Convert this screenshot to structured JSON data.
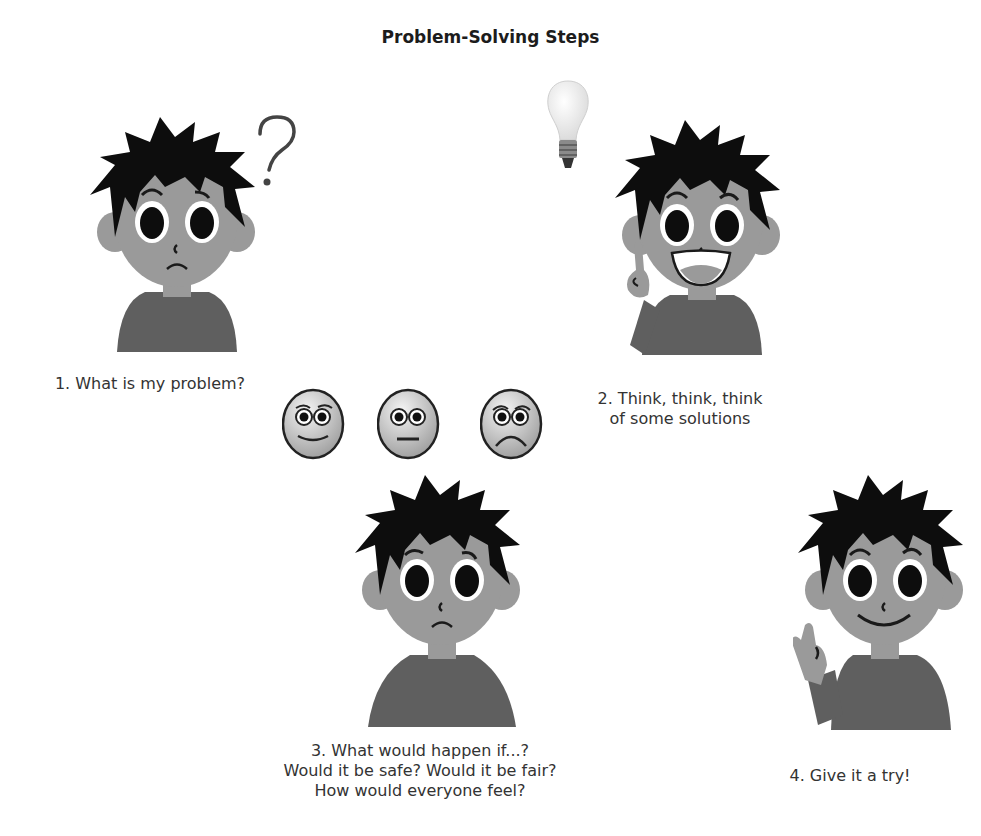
{
  "title": "Problem-Solving Steps",
  "colors": {
    "skin": "#9a9a9a",
    "shirt": "#5f5f5f",
    "hair": "#0d0d0d",
    "eye_white": "#ffffff",
    "text": "#333333"
  },
  "steps": [
    {
      "number": 1,
      "figure": "confused-boy-with-question-mark",
      "caption_lines": [
        "1. What is my problem?"
      ]
    },
    {
      "number": 2,
      "figure": "smiling-boy-pointing-up-with-lightbulb",
      "caption_lines": [
        "2. Think, think, think",
        "of some solutions"
      ]
    },
    {
      "number": 3,
      "figure": "thoughtful-boy-with-three-faces",
      "emotion_faces": [
        "happy-face",
        "neutral-face",
        "sad-face"
      ],
      "caption_lines": [
        "3. What would happen if...?",
        "Would it be safe? Would it be fair?",
        "How would everyone feel?"
      ]
    },
    {
      "number": 4,
      "figure": "smiling-boy-waving",
      "caption_lines": [
        "4. Give it a try!"
      ]
    }
  ],
  "decorations": {
    "question_mark": "?"
  }
}
